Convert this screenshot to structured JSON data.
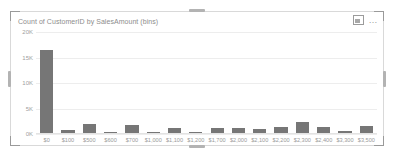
{
  "card": {
    "title": "Count of CustomerID by SalesAmount (bins)",
    "focus_icon": "focus-mode-icon",
    "more_icon": "…",
    "more_icon_name": "more-options-icon",
    "colors": {
      "bar": "#767676",
      "gridline": "#ededed",
      "border": "#d9d9d9",
      "text": "#9a9a9a",
      "background": "#ffffff"
    }
  },
  "chart_data": {
    "type": "bar",
    "title": "Count of CustomerID by SalesAmount (bins)",
    "xlabel": "",
    "ylabel": "",
    "ylim": [
      0,
      20000
    ],
    "grid": true,
    "legend": false,
    "ytick_labels": [
      "20K",
      "15K",
      "10K",
      "5K",
      "0K"
    ],
    "ytick_values": [
      20000,
      15000,
      10000,
      5000,
      0
    ],
    "categories": [
      "$0",
      "$100",
      "$500",
      "$600",
      "$700",
      "$1,000",
      "$1,100",
      "$1,200",
      "$1,700",
      "$2,000",
      "$2,100",
      "$2,200",
      "$2,300",
      "$2,400",
      "$3,300",
      "$3,500"
    ],
    "values": [
      16500,
      500,
      1800,
      200,
      1500,
      300,
      1000,
      300,
      900,
      1000,
      700,
      1200,
      2200,
      1100,
      400,
      1400
    ]
  }
}
